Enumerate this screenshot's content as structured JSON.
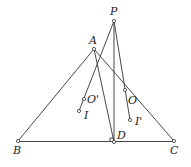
{
  "diagram": {
    "points": {
      "P": {
        "label": "P",
        "x": 114,
        "y": 21
      },
      "A": {
        "label": "A",
        "x": 94,
        "y": 49
      },
      "B": {
        "label": "B",
        "x": 18,
        "y": 141
      },
      "C": {
        "label": "C",
        "x": 174,
        "y": 141
      },
      "D": {
        "label": "D",
        "x": 114,
        "y": 142
      },
      "Op": {
        "label": "O'",
        "x": 84,
        "y": 99
      },
      "I": {
        "label": "I",
        "x": 79,
        "y": 111
      },
      "O": {
        "label": "O",
        "x": 125,
        "y": 90
      },
      "Ip": {
        "label": "I'",
        "x": 130,
        "y": 120
      }
    },
    "segments": [
      "AB",
      "AC",
      "BC",
      "AD",
      "PD",
      "P-O'-I",
      "P-O-I'"
    ],
    "right_angle_at": "D",
    "stroke_color": "#333333"
  }
}
